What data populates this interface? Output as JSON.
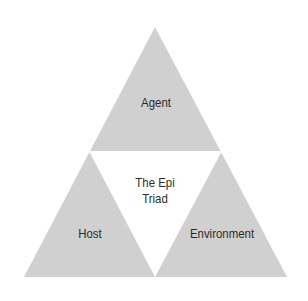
{
  "diagram": {
    "type": "triangle-triad",
    "colors": {
      "segment_fill": "#d0d0d0",
      "center_fill": "#ffffff",
      "text": "#2b2b2b",
      "background": "#ffffff"
    },
    "segments": {
      "top": {
        "label": "Agent"
      },
      "bottom_left": {
        "label": "Host"
      },
      "bottom_right": {
        "label": "Environment"
      }
    },
    "center": {
      "line1": "The Epi",
      "line2": "Triad"
    }
  }
}
